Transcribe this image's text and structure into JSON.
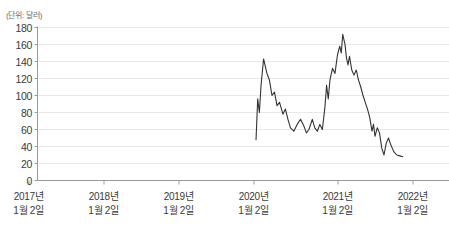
{
  "unit_label": "(단위: 달러)",
  "colors": {
    "line": "#333333",
    "axis": "#9a9a9a",
    "grid": "#e8e8e8",
    "text": "#3a3a3a",
    "unit_text": "#6b6b6b"
  },
  "chart_data": {
    "type": "line",
    "title": "",
    "subtitle": "",
    "xlabel": "",
    "ylabel": "(단위: 달러)",
    "unit": "달러",
    "grid": true,
    "legend": "none",
    "ylim": [
      0,
      180
    ],
    "ytick_values": [
      0,
      20,
      40,
      60,
      80,
      100,
      120,
      140,
      160,
      180
    ],
    "ytick_labels": [
      "0",
      "20",
      "40",
      "60",
      "80",
      "100",
      "120",
      "140",
      "160",
      "180"
    ],
    "xtick_labels": [
      {
        "line1": "2017년",
        "line2": "1월 2일"
      },
      {
        "line1": "2018년",
        "line2": "1월 2일"
      },
      {
        "line1": "2019년",
        "line2": "1월 2일"
      },
      {
        "line1": "2020년",
        "line2": "1월 2일"
      },
      {
        "line1": "2021년",
        "line2": "1월 2일"
      },
      {
        "line1": "2022년",
        "line2": "1월 2일"
      }
    ],
    "xlim_labels": [
      "2017년 1월 2일",
      "2022년 1월 2일 이후"
    ],
    "series": [
      {
        "name": "주가",
        "note": "데이터는 2021년 초부터 표시됨",
        "points": [
          {
            "x": 4.03,
            "y": 48
          },
          {
            "x": 4.05,
            "y": 96
          },
          {
            "x": 4.07,
            "y": 80
          },
          {
            "x": 4.09,
            "y": 112
          },
          {
            "x": 4.12,
            "y": 143
          },
          {
            "x": 4.16,
            "y": 126
          },
          {
            "x": 4.19,
            "y": 118
          },
          {
            "x": 4.22,
            "y": 100
          },
          {
            "x": 4.25,
            "y": 104
          },
          {
            "x": 4.28,
            "y": 88
          },
          {
            "x": 4.31,
            "y": 92
          },
          {
            "x": 4.35,
            "y": 78
          },
          {
            "x": 4.38,
            "y": 84
          },
          {
            "x": 4.41,
            "y": 72
          },
          {
            "x": 4.44,
            "y": 62
          },
          {
            "x": 4.48,
            "y": 58
          },
          {
            "x": 4.52,
            "y": 66
          },
          {
            "x": 4.56,
            "y": 72
          },
          {
            "x": 4.6,
            "y": 64
          },
          {
            "x": 4.63,
            "y": 56
          },
          {
            "x": 4.66,
            "y": 60
          },
          {
            "x": 4.7,
            "y": 72
          },
          {
            "x": 4.73,
            "y": 62
          },
          {
            "x": 4.76,
            "y": 58
          },
          {
            "x": 4.79,
            "y": 66
          },
          {
            "x": 4.82,
            "y": 60
          },
          {
            "x": 4.85,
            "y": 86
          },
          {
            "x": 4.87,
            "y": 112
          },
          {
            "x": 4.89,
            "y": 96
          },
          {
            "x": 4.91,
            "y": 118
          },
          {
            "x": 4.94,
            "y": 132
          },
          {
            "x": 4.97,
            "y": 126
          },
          {
            "x": 5.0,
            "y": 148
          },
          {
            "x": 5.03,
            "y": 158
          },
          {
            "x": 5.05,
            "y": 150
          },
          {
            "x": 5.07,
            "y": 172
          },
          {
            "x": 5.1,
            "y": 160
          },
          {
            "x": 5.12,
            "y": 144
          },
          {
            "x": 5.14,
            "y": 136
          },
          {
            "x": 5.16,
            "y": 146
          },
          {
            "x": 5.19,
            "y": 130
          },
          {
            "x": 5.22,
            "y": 124
          },
          {
            "x": 5.25,
            "y": 130
          },
          {
            "x": 5.28,
            "y": 118
          },
          {
            "x": 5.31,
            "y": 110
          },
          {
            "x": 5.34,
            "y": 100
          },
          {
            "x": 5.37,
            "y": 92
          },
          {
            "x": 5.4,
            "y": 84
          },
          {
            "x": 5.43,
            "y": 74
          },
          {
            "x": 5.46,
            "y": 58
          },
          {
            "x": 5.48,
            "y": 66
          },
          {
            "x": 5.5,
            "y": 52
          },
          {
            "x": 5.53,
            "y": 62
          },
          {
            "x": 5.56,
            "y": 56
          },
          {
            "x": 5.59,
            "y": 38
          },
          {
            "x": 5.62,
            "y": 30
          },
          {
            "x": 5.65,
            "y": 44
          },
          {
            "x": 5.68,
            "y": 50
          },
          {
            "x": 5.71,
            "y": 42
          },
          {
            "x": 5.75,
            "y": 34
          },
          {
            "x": 5.79,
            "y": 30
          },
          {
            "x": 5.83,
            "y": 29
          },
          {
            "x": 5.87,
            "y": 28
          }
        ]
      }
    ]
  }
}
